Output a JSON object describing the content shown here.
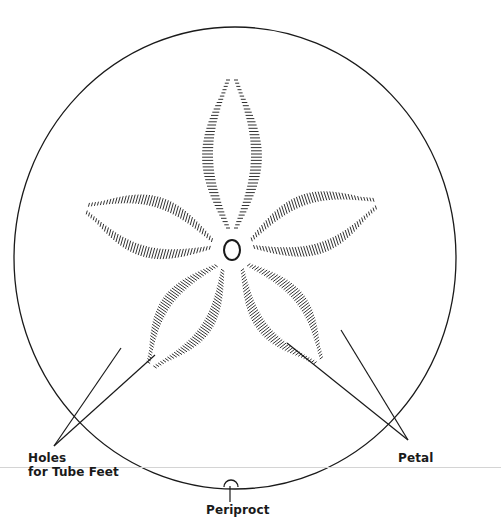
{
  "figure": {
    "labels": {
      "holes": "Holes",
      "holes_line2": "for Tube Feet",
      "petal": "Petal",
      "periproct": "Periproct"
    },
    "colors": {
      "ink": "#1a1a1a",
      "background": "#ffffff",
      "scanline": "#d4d4d4"
    },
    "test_outline": {
      "cx": 235,
      "cy": 258,
      "rx": 221,
      "ry": 231
    },
    "apical_disc": {
      "cx": 232,
      "cy": 250,
      "rx": 8,
      "ry": 10
    },
    "petals": [
      {
        "name": "petal-top",
        "angle": -90,
        "inner": 22,
        "outer": 170,
        "width": 34
      },
      {
        "name": "petal-upper-right",
        "angle": -18,
        "inner": 22,
        "outer": 150,
        "width": 36
      },
      {
        "name": "petal-lower-right",
        "angle": 52,
        "inner": 22,
        "outer": 140,
        "width": 32
      },
      {
        "name": "petal-lower-left",
        "angle": 125,
        "inner": 22,
        "outer": 140,
        "width": 32
      },
      {
        "name": "petal-upper-left",
        "angle": 196,
        "inner": 22,
        "outer": 150,
        "width": 36
      }
    ],
    "leaders": {
      "holes": [
        {
          "x1": 121,
          "y1": 348,
          "x2": 54,
          "y2": 446
        },
        {
          "x1": 155,
          "y1": 355,
          "x2": 54,
          "y2": 446
        }
      ],
      "petal": [
        {
          "x1": 287,
          "y1": 343,
          "x2": 408,
          "y2": 440
        },
        {
          "x1": 341,
          "y1": 330,
          "x2": 408,
          "y2": 440
        }
      ],
      "periproct": {
        "x1": 230,
        "y1": 486,
        "x2": 230,
        "y2": 502
      }
    },
    "periproct_arc": {
      "cx": 231,
      "cy": 487,
      "r": 7
    }
  }
}
